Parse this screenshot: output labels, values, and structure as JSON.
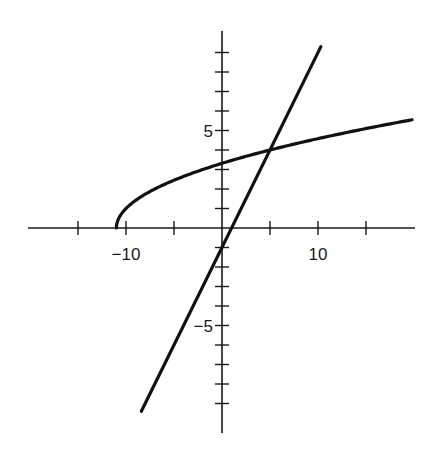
{
  "chart_data": {
    "type": "line",
    "title": "",
    "xlabel": "",
    "ylabel": "",
    "xlim": [
      -20.6,
      20.3
    ],
    "ylim": [
      -10.5,
      10.3
    ],
    "grid": false,
    "legend": null,
    "x_ticks": [
      -15,
      -10,
      -5,
      5,
      10,
      15
    ],
    "x_tick_labels": [
      {
        "value": -10,
        "text": "−10"
      },
      {
        "value": 10,
        "text": "10"
      }
    ],
    "y_ticks": [
      -9,
      -8,
      -7,
      -6,
      -5,
      -4,
      -3,
      -2,
      -1,
      1,
      2,
      3,
      4,
      5,
      6,
      7,
      8,
      9
    ],
    "y_tick_labels": [
      {
        "value": 5,
        "text": "5"
      },
      {
        "value": -5,
        "text": "−5"
      }
    ],
    "series": [
      {
        "name": "curve",
        "expression": "y = sqrt(x + 11)",
        "x_range": [
          -11,
          19.8
        ],
        "x": [
          -11,
          -10.5,
          -10,
          -9,
          -8,
          -6,
          -4,
          -2,
          0,
          2,
          5,
          8,
          11,
          14,
          17,
          19.8
        ],
        "values": [
          0,
          0.71,
          1,
          1.41,
          1.73,
          2.24,
          2.65,
          3.0,
          3.32,
          3.61,
          4.0,
          4.36,
          4.69,
          5.0,
          5.29,
          5.55
        ]
      },
      {
        "name": "line",
        "expression": "y = x - 1",
        "x": [
          -8.4,
          10.3
        ],
        "values": [
          -9.4,
          9.3
        ]
      }
    ],
    "annotations": [
      {
        "type": "intersection",
        "x": 5,
        "y": 4
      }
    ]
  },
  "layout": {
    "origin_px": [
      222,
      228
    ],
    "px_per_unit_x": 9.6,
    "px_per_unit_y": 19.5,
    "x_axis_px": [
      28,
      415
    ],
    "y_axis_px": [
      31,
      433
    ]
  }
}
